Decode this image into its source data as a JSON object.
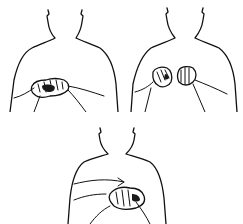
{
  "illustration": {
    "description": "Line drawing of three torsos demonstrating hand gestures",
    "figures": [
      {
        "id": "top-left",
        "gesture": "hands clasped at waist, one hand over the other"
      },
      {
        "id": "top-right",
        "gesture": "two fists held apart in front of chest"
      },
      {
        "id": "bottom-center",
        "gesture": "hand moves across to grasp other hand, with motion arrow"
      }
    ],
    "colors": {
      "background": "#ffffff",
      "ink": "#111111"
    }
  }
}
